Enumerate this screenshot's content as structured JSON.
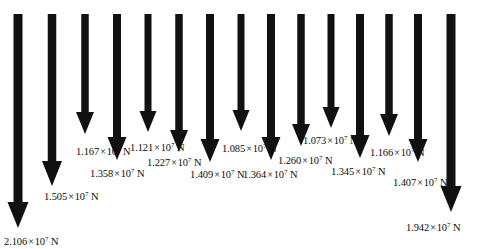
{
  "figure": {
    "type": "force-vector-diagram",
    "background_color": "#ffffff",
    "arrow_color": "#111111",
    "unit": "N",
    "exponent": "7",
    "multiplication_sign": "×",
    "base": "10",
    "arrow_count": 15
  },
  "arrows": [
    {
      "id": "arrow-1",
      "x": 18,
      "top": 14,
      "tip": 228,
      "shaft_w": 9.0,
      "head_w": 21,
      "head_h": 26,
      "value": "2.106",
      "label_x": 4,
      "label_y": 236,
      "label": "2.106×10⁷ N"
    },
    {
      "id": "arrow-2",
      "x": 52,
      "top": 14,
      "tip": 186,
      "shaft_w": 8.5,
      "head_w": 20,
      "head_h": 25,
      "value": "1.505",
      "label_x": 44,
      "label_y": 191,
      "label": "1.505×10⁷ N"
    },
    {
      "id": "arrow-3",
      "x": 85,
      "top": 14,
      "tip": 134,
      "shaft_w": 7.5,
      "head_w": 18,
      "head_h": 22,
      "value": "1.167",
      "label_x": 76,
      "label_y": 146,
      "label": "1.167×10⁷ N"
    },
    {
      "id": "arrow-4",
      "x": 117,
      "top": 14,
      "tip": 160,
      "shaft_w": 8.0,
      "head_w": 19,
      "head_h": 23,
      "value": "1.358",
      "label_x": 90,
      "label_y": 168,
      "label": "1.358×10⁷ N"
    },
    {
      "id": "arrow-5",
      "x": 148,
      "top": 14,
      "tip": 132,
      "shaft_w": 7.0,
      "head_w": 17,
      "head_h": 21,
      "value": "1.121",
      "label_x": 130,
      "label_y": 142,
      "label": "1.121×10⁷ N"
    },
    {
      "id": "arrow-6",
      "x": 179,
      "top": 14,
      "tip": 152,
      "shaft_w": 7.5,
      "head_w": 18,
      "head_h": 22,
      "value": "1.227",
      "label_x": 147,
      "label_y": 157,
      "label": "1.227×10⁷ N"
    },
    {
      "id": "arrow-7",
      "x": 210,
      "top": 14,
      "tip": 162,
      "shaft_w": 8.0,
      "head_w": 19,
      "head_h": 23,
      "value": "1.409",
      "label_x": 190,
      "label_y": 169,
      "label": "1.409×10⁷ N"
    },
    {
      "id": "arrow-8",
      "x": 241,
      "top": 14,
      "tip": 131,
      "shaft_w": 7.0,
      "head_w": 17,
      "head_h": 21,
      "value": "1.085",
      "label_x": 222,
      "label_y": 143,
      "label": "1.085×10⁷ N"
    },
    {
      "id": "arrow-9",
      "x": 271,
      "top": 14,
      "tip": 160,
      "shaft_w": 8.0,
      "head_w": 19,
      "head_h": 23,
      "value": "1.364",
      "label_x": 243,
      "label_y": 169,
      "label": "1.364×10⁷ N"
    },
    {
      "id": "arrow-10",
      "x": 301,
      "top": 14,
      "tip": 146,
      "shaft_w": 7.5,
      "head_w": 18,
      "head_h": 22,
      "value": "1.260",
      "label_x": 278,
      "label_y": 155,
      "label": "1.260×10⁷ N"
    },
    {
      "id": "arrow-11",
      "x": 331,
      "top": 14,
      "tip": 128,
      "shaft_w": 7.0,
      "head_w": 17,
      "head_h": 21,
      "value": "1.073",
      "label_x": 303,
      "label_y": 135,
      "label": "1.073×10⁷ N"
    },
    {
      "id": "arrow-12",
      "x": 360,
      "top": 14,
      "tip": 158,
      "shaft_w": 8.0,
      "head_w": 19,
      "head_h": 23,
      "value": "1.345",
      "label_x": 331,
      "label_y": 166,
      "label": "1.345×10⁷ N"
    },
    {
      "id": "arrow-13",
      "x": 389,
      "top": 14,
      "tip": 136,
      "shaft_w": 7.5,
      "head_w": 18,
      "head_h": 22,
      "value": "1.166",
      "label_x": 370,
      "label_y": 147,
      "label": "1.166×10⁷ N"
    },
    {
      "id": "arrow-14",
      "x": 418,
      "top": 14,
      "tip": 162,
      "shaft_w": 8.0,
      "head_w": 19,
      "head_h": 23,
      "value": "1.407",
      "label_x": 393,
      "label_y": 177,
      "label": "1.407×10⁷ N"
    },
    {
      "id": "arrow-15",
      "x": 451,
      "top": 14,
      "tip": 212,
      "shaft_w": 9.0,
      "head_w": 21,
      "head_h": 26,
      "value": "1.942",
      "label_x": 406,
      "label_y": 222,
      "label": "1.942×10⁷ N"
    }
  ]
}
